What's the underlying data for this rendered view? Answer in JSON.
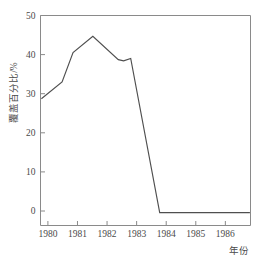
{
  "chart_data": {
    "type": "line",
    "title": "",
    "subtitle": "",
    "xlabel": "年份",
    "ylabel": "覆盖百分比/%",
    "xlim": [
      1979.75,
      1986.85
    ],
    "ylim": [
      -1.5,
      50
    ],
    "grid": false,
    "legend": null,
    "x_ticks": [
      1980,
      1981,
      1982,
      1983,
      1984,
      1985,
      1986
    ],
    "x_tick_labels": [
      "1980",
      "1981",
      "1982",
      "1983",
      "1984",
      "1985",
      "1986"
    ],
    "y_ticks": [
      0,
      10,
      20,
      30,
      40,
      50
    ],
    "y_tick_labels": [
      "0",
      "10",
      "20",
      "30",
      "40",
      "50"
    ],
    "line_color": "#4f4f4f",
    "axis_color": "#8a8a8a",
    "series": [
      {
        "name": "覆盖百分比",
        "x": [
          1979.78,
          1980.48,
          1980.85,
          1981.52,
          1982.38,
          1982.56,
          1982.8,
          1983.78,
          1986.83
        ],
        "y": [
          28.7,
          33.0,
          40.5,
          44.7,
          38.7,
          38.4,
          39.0,
          -0.4,
          -0.4
        ]
      }
    ],
    "annotations": []
  }
}
